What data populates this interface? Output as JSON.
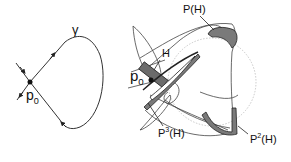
{
  "left_panel": {
    "curve_label": "γ",
    "point_label": "p",
    "point_subscript": "0"
  },
  "right_panel": {
    "point_label": "p",
    "point_subscript": "0",
    "box_label": "H",
    "map1_label": "P(H)",
    "map2_prefix": "P",
    "map2_power": "2",
    "map2_suffix": "(H)",
    "map3_prefix": "P",
    "map3_power": "3",
    "map3_suffix": "(H)"
  },
  "colors": {
    "line": "#333333",
    "shaded": "#7a7a7a",
    "dotted_circle": "#b0b0b0",
    "background": "#ffffff"
  }
}
